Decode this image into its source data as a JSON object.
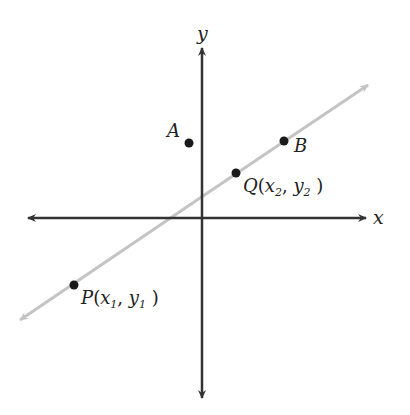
{
  "diagram": {
    "axes": {
      "x_label": "x",
      "y_label": "y",
      "color": "#333333"
    },
    "line": {
      "color": "#c0c0c0",
      "description": "line through P and Q"
    },
    "points": [
      {
        "id": "A",
        "label": "A",
        "x": 189,
        "y": 143
      },
      {
        "id": "B",
        "label": "B",
        "x": 284,
        "y": 141
      },
      {
        "id": "Q",
        "label_main": "Q",
        "label_x": "x",
        "label_x_sub": "2",
        "label_y": "y",
        "label_y_sub": "2",
        "x": 236,
        "y": 173
      },
      {
        "id": "P",
        "label_main": "P",
        "label_x": "x",
        "label_x_sub": "1",
        "label_y": "y",
        "label_y_sub": "1",
        "x": 74,
        "y": 285
      }
    ],
    "point_color": "#1a1a1a"
  }
}
